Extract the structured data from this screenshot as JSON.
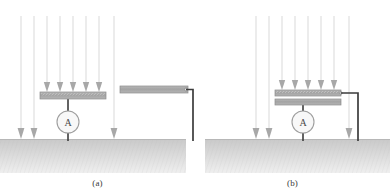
{
  "figure": {
    "background_color": "#ffffff"
  },
  "colors": {
    "field_line": "#d9d9d9",
    "field_arrowhead": "#a8a8a8",
    "plate_fill": "#a9a9a9",
    "plate_edge": "#8c8c8c",
    "plate_hatch": "#c4c4c4",
    "wire": "#3c3c3c",
    "ground_top": "#cfcfcf",
    "ground_bottom": "#e8e8e8",
    "meter_stroke": "#9a9a9a",
    "meter_fill": "#f7f7f7",
    "text": "#3a3a3a"
  },
  "panels": [
    {
      "id": "a",
      "caption": "(a)",
      "meter_label": "A",
      "field_line_count": 8,
      "arrowheads_on_plate": 5,
      "arrowheads_on_ground": 3,
      "plates": [
        {
          "name": "collector-plate",
          "x": 40,
          "y": 92,
          "width": 66,
          "height": 7,
          "hatched": true
        },
        {
          "name": "auxiliary-plate",
          "x": 120,
          "y": 86,
          "width": 68,
          "height": 7,
          "hatched": false
        }
      ],
      "ground": {
        "y": 139,
        "height": 34
      },
      "has_ammeter": true,
      "ammeter": {
        "cx": 68,
        "cy": 122,
        "r": 11
      }
    },
    {
      "id": "b",
      "caption": "(b)",
      "meter_label": "A",
      "field_line_count": 8,
      "arrowheads_on_plate": 5,
      "arrowheads_on_ground": 3,
      "plates": [
        {
          "name": "upper-collector-plate",
          "x": 275,
          "y": 90,
          "width": 66,
          "height": 6,
          "hatched": true
        },
        {
          "name": "lower-collector-plate",
          "x": 275,
          "y": 99,
          "width": 66,
          "height": 6,
          "hatched": false
        }
      ],
      "ground": {
        "y": 139,
        "height": 34
      },
      "has_ammeter": true,
      "ammeter": {
        "cx": 303,
        "cy": 122,
        "r": 11
      }
    }
  ]
}
